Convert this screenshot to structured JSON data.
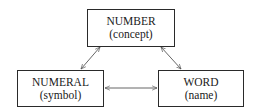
{
  "diagram": {
    "nodes": [
      {
        "id": "number",
        "title": "NUMBER",
        "subtitle": "(concept)"
      },
      {
        "id": "numeral",
        "title": "NUMERAL",
        "subtitle": "(symbol)"
      },
      {
        "id": "word",
        "title": "WORD",
        "subtitle": "(name)"
      }
    ],
    "edges": [
      {
        "from": "number",
        "to": "numeral",
        "type": "bidirectional"
      },
      {
        "from": "number",
        "to": "word",
        "type": "bidirectional"
      },
      {
        "from": "numeral",
        "to": "word",
        "type": "bidirectional"
      }
    ],
    "colors": {
      "line": "#555555",
      "border": "#2a2a2a",
      "text": "#1a1a1a"
    }
  }
}
